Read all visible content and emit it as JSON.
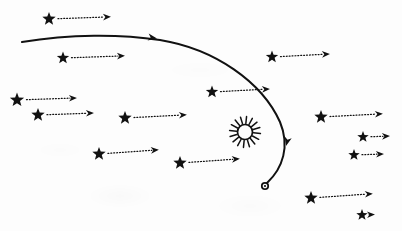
{
  "figure": {
    "background_color": "#fdfdfd",
    "ink_color": "#111111",
    "canvas": {
      "width": 402,
      "height": 231
    }
  },
  "sun": {
    "label": "sun-symbol",
    "center_x": 245,
    "center_y": 132,
    "core_radius": 7.5,
    "ray_count": 16,
    "ray_length": 8
  },
  "comet": {
    "label": "comet-nucleus",
    "x": 265,
    "y": 186,
    "radius": 3.2
  },
  "trajectory": {
    "label": "comet-path",
    "stroke_width": 2.0,
    "path": "M 22,42 C 70,34 120,34 160,40 C 215,49 262,82 280,122 C 290,146 283,168 267,183",
    "arrowheads": [
      {
        "x": 157,
        "y": 38.4,
        "angle": 9
      },
      {
        "x": 286,
        "y": 146,
        "angle": 104
      }
    ]
  },
  "stars": [
    {
      "id": "star-1",
      "x": 49,
      "y": 19,
      "size": 7.0,
      "arrow_length": 62,
      "arrow_angle": -2
    },
    {
      "id": "star-2",
      "x": 63,
      "y": 58,
      "size": 6.5,
      "arrow_length": 62,
      "arrow_angle": -2
    },
    {
      "id": "star-3",
      "x": 17,
      "y": 100,
      "size": 7.5,
      "arrow_length": 60,
      "arrow_angle": -2
    },
    {
      "id": "star-4",
      "x": 38,
      "y": 115,
      "size": 7.0,
      "arrow_length": 56,
      "arrow_angle": -2
    },
    {
      "id": "star-5",
      "x": 125,
      "y": 118,
      "size": 7.0,
      "arrow_length": 62,
      "arrow_angle": -3
    },
    {
      "id": "star-6",
      "x": 99,
      "y": 154,
      "size": 7.0,
      "arrow_length": 60,
      "arrow_angle": -4
    },
    {
      "id": "star-7",
      "x": 180,
      "y": 163,
      "size": 7.0,
      "arrow_length": 60,
      "arrow_angle": -4
    },
    {
      "id": "star-8",
      "x": 212,
      "y": 92,
      "size": 6.5,
      "arrow_length": 58,
      "arrow_angle": -3
    },
    {
      "id": "star-9",
      "x": 272,
      "y": 57,
      "size": 6.5,
      "arrow_length": 58,
      "arrow_angle": -3
    },
    {
      "id": "star-10",
      "x": 321,
      "y": 117,
      "size": 7.0,
      "arrow_length": 62,
      "arrow_angle": -3
    },
    {
      "id": "star-11",
      "x": 363,
      "y": 137,
      "size": 6.0,
      "arrow_length": 27,
      "arrow_angle": -2
    },
    {
      "id": "star-12",
      "x": 354,
      "y": 155,
      "size": 6.0,
      "arrow_length": 30,
      "arrow_angle": -2
    },
    {
      "id": "star-13",
      "x": 311,
      "y": 198,
      "size": 7.0,
      "arrow_length": 62,
      "arrow_angle": -4
    },
    {
      "id": "star-14",
      "x": 362,
      "y": 215,
      "size": 6.0,
      "arrow_length": 13,
      "arrow_angle": -2
    }
  ]
}
